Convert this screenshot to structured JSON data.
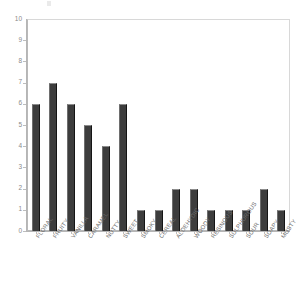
{
  "chart_data": {
    "type": "bar",
    "title": "",
    "subtitle": "",
    "xlabel": "",
    "ylabel": "",
    "ylim": [
      0,
      10
    ],
    "ytick_labels": [
      "10",
      "9",
      "8",
      "7",
      "6",
      "5",
      "4",
      "3",
      "2",
      "1",
      "0"
    ],
    "ytick_values": [
      10,
      9,
      8,
      7,
      6,
      5,
      4,
      3,
      2,
      1,
      0
    ],
    "grid": false,
    "legend": null,
    "legend_position": "none",
    "bar_color": "#3d3d3d",
    "axis_color": "#b5b5b5",
    "label_color": "#6f6f6f",
    "categories": [
      "FLORAL",
      "FRUITY",
      "VANILLA",
      "CARAMEL",
      "NUTTY",
      "SWEET",
      "SMOKY",
      "CEREAL",
      "ALDEHYDIC",
      "WOODY",
      "RESINOUS",
      "SULPHUROUS",
      "SOUR",
      "SOAPY",
      "MUSTY"
    ],
    "values": [
      6,
      7,
      6,
      5,
      4,
      6,
      1,
      1,
      2,
      2,
      1,
      1,
      1,
      2,
      1
    ]
  }
}
